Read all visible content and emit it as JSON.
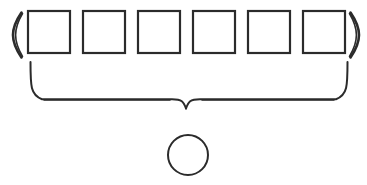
{
  "figure": {
    "title": "Sequence of six empty boxes grouped by a brace to a single circle",
    "background_color": "#ffffff",
    "stroke_color": "#2b2b2b",
    "width": 367,
    "height": 185
  },
  "group": {
    "open_paren": "(",
    "close_paren": ")",
    "open_paren_name": "left-parenthesis",
    "close_paren_name": "right-parenthesis",
    "box_count": 6,
    "boxes": [
      {
        "index": 1,
        "label": "",
        "x": 28,
        "y": 11,
        "size": 42
      },
      {
        "index": 2,
        "label": "",
        "x": 83,
        "y": 11,
        "size": 42
      },
      {
        "index": 3,
        "label": "",
        "x": 138,
        "y": 11,
        "size": 42
      },
      {
        "index": 4,
        "label": "",
        "x": 193,
        "y": 11,
        "size": 42
      },
      {
        "index": 5,
        "label": "",
        "x": 248,
        "y": 11,
        "size": 42
      },
      {
        "index": 6,
        "label": "",
        "x": 303,
        "y": 11,
        "size": 42
      }
    ]
  },
  "brace": {
    "orientation": "down",
    "left_x": 30,
    "right_x": 348,
    "top_y": 62,
    "bottom_y": 100,
    "tip_x": 186,
    "tip_y": 109,
    "label": ""
  },
  "result": {
    "shape": "circle",
    "label": "",
    "center_x": 188,
    "center_y": 155,
    "radius": 20
  }
}
